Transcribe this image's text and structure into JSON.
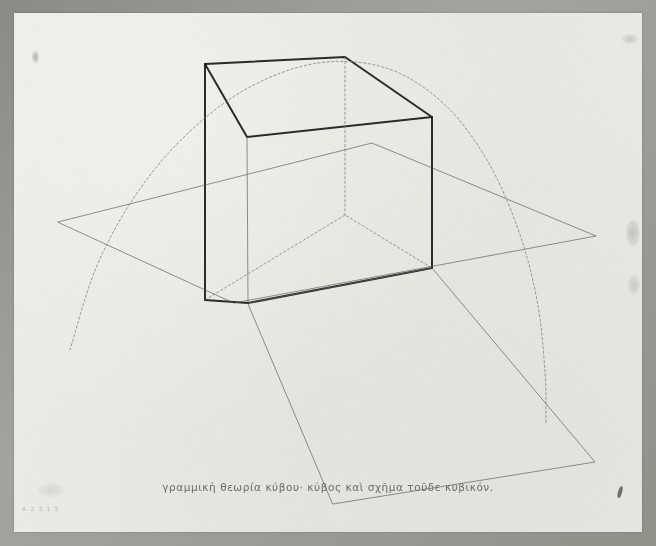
{
  "artwork": {
    "title": "Linear theory of the cube",
    "medium_surface": "aged drawing paper",
    "caption": "γραμμικὴ θεωρία κύβου· κύβος καὶ σχῆμα τοῦδε κυβικόν.",
    "pencil_note": "A 2 3 1 5",
    "colors": {
      "paper": "#eceae5",
      "mount": "#96978f",
      "heavy_ink": "#1a1a1a",
      "light_ink": "#5d5d5a",
      "dotted_ink": "#7a7a76",
      "caption_ink": "#6d6c68"
    }
  },
  "chart_data": {
    "type": "line",
    "title": "γραμμικὴ θεωρία κύβου· κύβος καὶ σχῆμα τοῦδε κυβικόν.",
    "xlabel": "",
    "ylabel": "",
    "grid": false,
    "legend": "none",
    "xlim": [
      0,
      656
    ],
    "ylim": [
      0,
      546
    ],
    "series": [
      {
        "name": "cube-top-face",
        "style": "solid-heavy",
        "closed": true,
        "points": [
          [
            205,
            64
          ],
          [
            345,
            57
          ],
          [
            432,
            117
          ],
          [
            247,
            137
          ]
        ]
      },
      {
        "name": "cube-front-left-vertical",
        "style": "solid-heavy",
        "points": [
          [
            205,
            64
          ],
          [
            205,
            300
          ]
        ]
      },
      {
        "name": "cube-front-center-vertical",
        "style": "solid-light",
        "points": [
          [
            247,
            137
          ],
          [
            248,
            303
          ]
        ]
      },
      {
        "name": "cube-right-vertical",
        "style": "solid-heavy",
        "points": [
          [
            432,
            117
          ],
          [
            432,
            268
          ]
        ]
      },
      {
        "name": "cube-back-vertical-hidden",
        "style": "dotted",
        "points": [
          [
            345,
            57
          ],
          [
            345,
            215
          ]
        ]
      },
      {
        "name": "cube-bottom-front-left-edge",
        "style": "solid-heavy",
        "points": [
          [
            205,
            300
          ],
          [
            248,
            303
          ]
        ]
      },
      {
        "name": "cube-bottom-front-right-edge",
        "style": "solid-heavy",
        "points": [
          [
            248,
            303
          ],
          [
            432,
            268
          ]
        ]
      },
      {
        "name": "cube-bottom-back-edge-hidden",
        "style": "dotted",
        "points": [
          [
            205,
            300
          ],
          [
            345,
            215
          ],
          [
            432,
            268
          ]
        ]
      },
      {
        "name": "horizontal-plane",
        "style": "solid-light",
        "closed": true,
        "points": [
          [
            58,
            222
          ],
          [
            372,
            143
          ],
          [
            596,
            236
          ],
          [
            234,
            303
          ]
        ]
      },
      {
        "name": "oblique-ground-plane",
        "style": "solid-light",
        "closed": true,
        "points": [
          [
            248,
            303
          ],
          [
            432,
            268
          ],
          [
            595,
            462
          ],
          [
            333,
            504
          ]
        ]
      },
      {
        "name": "parabolic-arc",
        "style": "dotted",
        "points": [
          [
            70,
            350
          ],
          [
            96,
            268
          ],
          [
            135,
            196
          ],
          [
            186,
            135
          ],
          [
            248,
            88
          ],
          [
            318,
            63
          ],
          [
            386,
            68
          ],
          [
            443,
            103
          ],
          [
            487,
            160
          ],
          [
            518,
            229
          ],
          [
            537,
            300
          ],
          [
            545,
            372
          ],
          [
            546,
            424
          ]
        ]
      }
    ]
  }
}
